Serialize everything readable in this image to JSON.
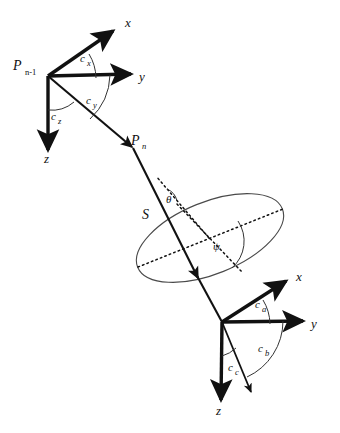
{
  "figure": {
    "type": "geometric-vector-diagram",
    "background_color": "#ffffff",
    "stroke_color": "#111111"
  },
  "top_frame": {
    "name": "upper-left-coordinate-frame",
    "origin_label": "P",
    "origin_subscript": "n-1",
    "axes": [
      {
        "id": "x",
        "label": "x"
      },
      {
        "id": "y",
        "label": "y"
      },
      {
        "id": "z",
        "label": "z"
      }
    ],
    "angles": [
      {
        "id": "cx",
        "label": "c",
        "subscript": "x"
      },
      {
        "id": "cy",
        "label": "c",
        "subscript": "y"
      },
      {
        "id": "cz",
        "label": "c",
        "subscript": "z"
      }
    ]
  },
  "bottom_frame": {
    "name": "lower-right-coordinate-frame",
    "axes": [
      {
        "id": "x",
        "label": "x"
      },
      {
        "id": "y",
        "label": "y"
      },
      {
        "id": "z",
        "label": "z"
      }
    ],
    "angles": [
      {
        "id": "ca",
        "label": "c",
        "subscript": "a"
      },
      {
        "id": "cb",
        "label": "c",
        "subscript": "b"
      },
      {
        "id": "cc",
        "label": "c",
        "subscript": "c"
      }
    ]
  },
  "vector": {
    "name": "main-direction-vector",
    "point_label": "P",
    "point_subscript": "n"
  },
  "ellipse": {
    "name": "inclined-disc",
    "surface_label": "S",
    "angles": [
      {
        "id": "theta",
        "label": "θ"
      },
      {
        "id": "psi",
        "label": "ψ"
      }
    ]
  }
}
